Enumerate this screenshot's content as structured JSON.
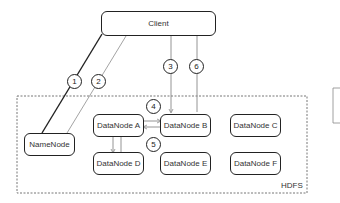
{
  "diagram": {
    "client": {
      "label": "Client"
    },
    "hdfs": {
      "label": "HDFS"
    },
    "namenode": {
      "label": "NameNode"
    },
    "datanodes": [
      {
        "id": "A",
        "label": "DataNode A"
      },
      {
        "id": "B",
        "label": "DataNode B"
      },
      {
        "id": "C",
        "label": "DataNode C"
      },
      {
        "id": "D",
        "label": "DataNode D"
      },
      {
        "id": "E",
        "label": "DataNode E"
      },
      {
        "id": "F",
        "label": "DataNode F"
      }
    ],
    "steps": [
      "1",
      "2",
      "3",
      "6",
      "4",
      "5"
    ],
    "colors": {
      "stroke": "#222222",
      "light_stroke": "#888888",
      "dashed": "#777777"
    }
  }
}
